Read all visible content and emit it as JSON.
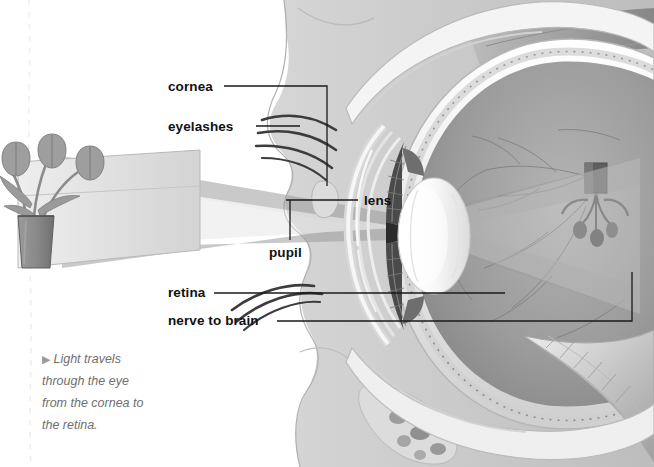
{
  "figure": {
    "type": "anatomical-diagram",
    "orientation": "light enters from left, image inverted on retina at right"
  },
  "labels": [
    {
      "id": "cornea",
      "text": "cornea",
      "x": 168,
      "y": 80,
      "leader": "right-then-down"
    },
    {
      "id": "eyelashes",
      "text": "eyelashes",
      "x": 168,
      "y": 120,
      "leader": "right"
    },
    {
      "id": "lens",
      "text": "lens",
      "x": 364,
      "y": 194,
      "leader": "left"
    },
    {
      "id": "pupil",
      "text": "pupil",
      "x": 269,
      "y": 246,
      "leader": "up-then-right"
    },
    {
      "id": "retina",
      "text": "retina",
      "x": 168,
      "y": 288,
      "leader": "right"
    },
    {
      "id": "nerve-to-brain",
      "text": "nerve to brain",
      "x": 168,
      "y": 316,
      "leader": "right-then-up"
    }
  ],
  "caption": {
    "bullet": "▶",
    "lines": [
      "Light travels",
      "through the eye",
      "from the cornea to",
      "the retina."
    ],
    "text": "Light travels through the eye from the cornea to the retina."
  },
  "scene_objects": [
    {
      "name": "tulips-in-vase",
      "role": "object being viewed",
      "side": "left"
    },
    {
      "name": "inverted-tulip-image",
      "role": "image formed on retina",
      "side": "right"
    },
    {
      "name": "light-ray-cone",
      "role": "light path crossing at the lens"
    },
    {
      "name": "head-profile",
      "role": "silhouette of face in cross-section"
    }
  ],
  "colors": {
    "ink": "#111111",
    "caption_text": "#6e6e6e",
    "ray_band": "#a9a9a9",
    "head_fill": "#c9c9c9",
    "sclera": "#f2f2f2",
    "vitreous": "#9a9a9a",
    "page": "#ffffff"
  }
}
